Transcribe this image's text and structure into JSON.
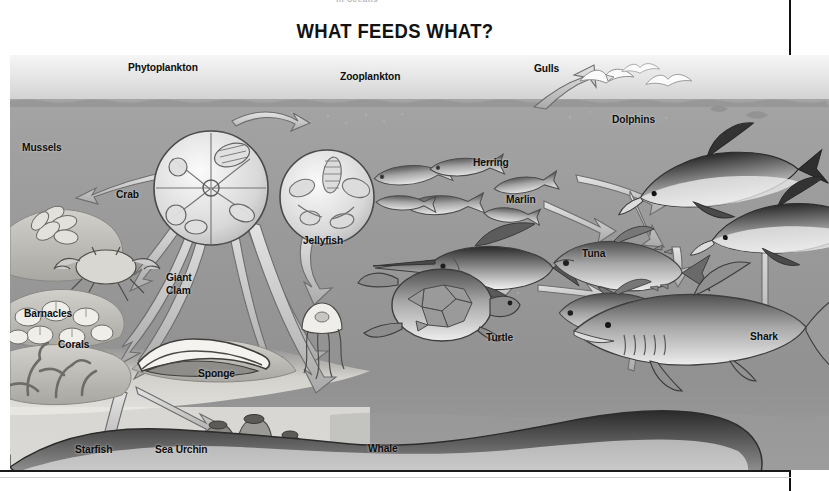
{
  "page": {
    "cropped_header_text": "in oceans",
    "title": "WHAT FEEDS WHAT?"
  },
  "illustration": {
    "name": "ocean-food-web-illustration",
    "style": "grayscale airbrush diagram of an ocean food web with arrows showing what feeds what",
    "zones": {
      "sky": "light gray gradient sky above waterline",
      "waterline": "horizontal wave line about 45px below the top of the illustration",
      "water": "mid gray ocean gradient darkening with depth",
      "seabed": "pale sandy seafloor along the bottom left"
    },
    "colors": {
      "sky_top": "#f2f2f2",
      "sky_bottom": "#d6d6d6",
      "water_top": "#9d9d9d",
      "water_bottom": "#8c8c8c",
      "seabed": "#e6e4df",
      "label_text": "#0d0d0d",
      "arrow_fill": "#c9c9c9",
      "arrow_stroke": "#585858",
      "frame_rule": "#101010"
    },
    "labels": [
      {
        "id": "phytoplankton",
        "text": "Phytoplankton",
        "x": 118,
        "y": 6
      },
      {
        "id": "zooplankton",
        "text": "Zooplankton",
        "x": 330,
        "y": 15
      },
      {
        "id": "gulls",
        "text": "Gulls",
        "x": 524,
        "y": 7
      },
      {
        "id": "dolphins",
        "text": "Dolphins",
        "x": 602,
        "y": 58
      },
      {
        "id": "mussels",
        "text": "Mussels",
        "x": 12,
        "y": 86
      },
      {
        "id": "crab",
        "text": "Crab",
        "x": 106,
        "y": 133
      },
      {
        "id": "herring",
        "text": "Herring",
        "x": 463,
        "y": 101
      },
      {
        "id": "marlin",
        "text": "Marlin",
        "x": 496,
        "y": 138
      },
      {
        "id": "tuna",
        "text": "Tuna",
        "x": 572,
        "y": 192
      },
      {
        "id": "jellyfish",
        "text": "Jellyfish",
        "x": 293,
        "y": 179
      },
      {
        "id": "barnacles",
        "text": "Barnacles",
        "x": 14,
        "y": 252
      },
      {
        "id": "giant-clam",
        "text": "Giant\nClam",
        "x": 156,
        "y": 216
      },
      {
        "id": "corals",
        "text": "Corals",
        "x": 48,
        "y": 283
      },
      {
        "id": "sponge",
        "text": "Sponge",
        "x": 188,
        "y": 312
      },
      {
        "id": "turtle",
        "text": "Turtle",
        "x": 476,
        "y": 276
      },
      {
        "id": "shark",
        "text": "Shark",
        "x": 740,
        "y": 275
      },
      {
        "id": "starfish",
        "text": "Starfish",
        "x": 65,
        "y": 388
      },
      {
        "id": "sea-urchin",
        "text": "Sea Urchin",
        "x": 145,
        "y": 388
      },
      {
        "id": "whale",
        "text": "Whale",
        "x": 358,
        "y": 387
      }
    ],
    "feeding_arrows": [
      {
        "from": "phytoplankton",
        "to": "mussels"
      },
      {
        "from": "phytoplankton",
        "to": "zooplankton"
      },
      {
        "from": "phytoplankton",
        "to": "crab"
      },
      {
        "from": "phytoplankton",
        "to": "barnacles"
      },
      {
        "from": "phytoplankton",
        "to": "corals"
      },
      {
        "from": "phytoplankton",
        "to": "giant-clam"
      },
      {
        "from": "phytoplankton",
        "to": "sponge"
      },
      {
        "from": "zooplankton",
        "to": "jellyfish"
      },
      {
        "from": "zooplankton",
        "to": "whale"
      },
      {
        "from": "corals",
        "to": "starfish"
      },
      {
        "from": "corals",
        "to": "sea-urchin"
      },
      {
        "from": "herring",
        "to": "gulls"
      },
      {
        "from": "herring",
        "to": "dolphins"
      },
      {
        "from": "herring",
        "to": "tuna"
      },
      {
        "from": "herring",
        "to": "marlin"
      },
      {
        "from": "marlin",
        "to": "turtle"
      },
      {
        "from": "turtle",
        "to": "shark"
      },
      {
        "from": "tuna",
        "to": "shark"
      },
      {
        "from": "dolphins",
        "to": "shark"
      },
      {
        "from": "whale",
        "to": "shark"
      }
    ]
  }
}
